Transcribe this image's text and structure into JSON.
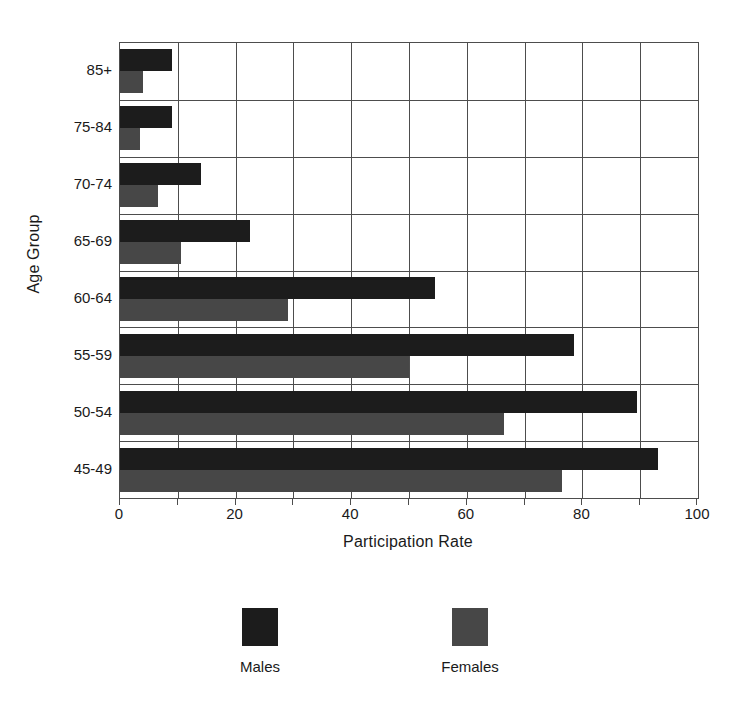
{
  "chart_data": {
    "type": "bar",
    "orientation": "horizontal",
    "title": "",
    "xlabel": "Participation Rate",
    "ylabel": "Age Group",
    "xlim": [
      0,
      100
    ],
    "xticks": [
      0,
      20,
      40,
      60,
      80,
      100
    ],
    "xtick_labels": [
      "0",
      "20",
      "40",
      "60",
      "80",
      "100"
    ],
    "minor_gridlines_every": 10,
    "grid": true,
    "legend_position": "bottom",
    "categories": [
      "85+",
      "75-84",
      "70-74",
      "65-69",
      "60-64",
      "55-59",
      "50-54",
      "45-49"
    ],
    "series": [
      {
        "name": "Males",
        "color": "#1c1c1c",
        "values": [
          9,
          9,
          14,
          22.5,
          54.5,
          78.5,
          89.5,
          93
        ]
      },
      {
        "name": "Females",
        "color": "#474747",
        "values": [
          4,
          3.5,
          6.5,
          10.5,
          29,
          50,
          66.5,
          76.5
        ]
      }
    ]
  },
  "legend": {
    "entries": [
      {
        "label": "Males",
        "swatch": "legend-swatch-male"
      },
      {
        "label": "Females",
        "swatch": "legend-swatch-female"
      }
    ]
  }
}
